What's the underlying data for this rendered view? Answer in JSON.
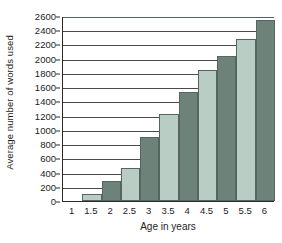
{
  "chart_data": {
    "type": "bar",
    "title": "",
    "xlabel": "Age in years",
    "ylabel": "Average number of words used",
    "categories": [
      "1",
      "1.5",
      "2",
      "2.5",
      "3",
      "3.5",
      "4",
      "4.5",
      "5",
      "5.5",
      "6"
    ],
    "values": [
      0,
      100,
      280,
      470,
      900,
      1220,
      1530,
      1840,
      2040,
      2280,
      2550
    ],
    "series": [
      {
        "name": "Average number of words used",
        "values": [
          0,
          100,
          280,
          470,
          900,
          1220,
          1530,
          1840,
          2040,
          2280,
          2550
        ]
      }
    ],
    "ylim": [
      0,
      2600
    ],
    "ytick_step": 200,
    "yticks": [
      0,
      200,
      400,
      600,
      800,
      1000,
      1200,
      1400,
      1600,
      1800,
      2000,
      2200,
      2400,
      2600
    ],
    "ytick_labels": [
      "0",
      "200",
      "400",
      "600",
      "800",
      "1000",
      "1200",
      "1400",
      "1600",
      "1800",
      "2000",
      "2200",
      "2400",
      "2600"
    ],
    "grid": true,
    "grid_axis": "y",
    "legend": false,
    "legend_position": "none",
    "bar_colors": {
      "light": "#b9cdc5",
      "dark": "#6d8278",
      "border": "#55665f"
    },
    "bar_color_pattern": [
      "light",
      "light",
      "dark",
      "light",
      "dark",
      "light",
      "dark",
      "light",
      "dark",
      "light",
      "dark"
    ],
    "axis_color": "#2b2b2b",
    "gridline_color": "#4a4a4a",
    "background": "#ffffff"
  }
}
